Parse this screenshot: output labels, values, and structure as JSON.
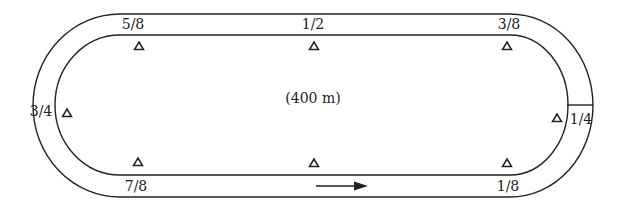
{
  "diagram": {
    "center_label": "(400 m)",
    "direction_arrow": "arrow-right",
    "colors": {
      "line": "#222222",
      "background": "#ffffff"
    },
    "markers": [
      {
        "id": "one-eighth",
        "label": "1/8"
      },
      {
        "id": "one-quarter",
        "label": "1/4"
      },
      {
        "id": "three-eighths",
        "label": "3/8"
      },
      {
        "id": "one-half",
        "label": "1/2"
      },
      {
        "id": "five-eighths",
        "label": "5/8"
      },
      {
        "id": "three-quarters",
        "label": "3/4"
      },
      {
        "id": "seven-eighths",
        "label": "7/8"
      }
    ],
    "cones": [
      {
        "id": "cone-top-left",
        "icon": "triangle-icon"
      },
      {
        "id": "cone-top-center",
        "icon": "triangle-icon"
      },
      {
        "id": "cone-top-right",
        "icon": "triangle-icon"
      },
      {
        "id": "cone-right",
        "icon": "triangle-icon"
      },
      {
        "id": "cone-bottom-right",
        "icon": "triangle-icon"
      },
      {
        "id": "cone-bottom-center",
        "icon": "triangle-icon"
      },
      {
        "id": "cone-bottom-left",
        "icon": "triangle-icon"
      },
      {
        "id": "cone-left",
        "icon": "triangle-icon"
      }
    ]
  }
}
